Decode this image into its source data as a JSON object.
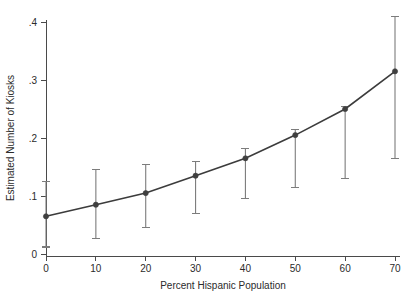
{
  "chart_data": {
    "type": "line",
    "title": "",
    "subtitle": "",
    "xlabel": "Percent Hispanic Population",
    "ylabel": "Estimated Number of Kiosks",
    "x": [
      0,
      10,
      20,
      30,
      40,
      50,
      60,
      70
    ],
    "values": [
      0.065,
      0.085,
      0.105,
      0.135,
      0.165,
      0.205,
      0.25,
      0.315
    ],
    "err_low": [
      0.012,
      0.027,
      0.045,
      0.07,
      0.095,
      0.115,
      0.13,
      0.165
    ],
    "err_high": [
      0.125,
      0.145,
      0.155,
      0.16,
      0.182,
      0.215,
      0.255,
      0.41
    ],
    "xlim": [
      0,
      70
    ],
    "ylim": [
      0,
      0.4
    ],
    "xticks": [
      0,
      10,
      20,
      30,
      40,
      50,
      60,
      70
    ],
    "xtick_labels": [
      "0",
      "10",
      "20",
      "30",
      "40",
      "50",
      "60",
      "70"
    ],
    "yticks": [
      0,
      0.1,
      0.2,
      0.3,
      0.4
    ],
    "ytick_labels": [
      "0",
      ".1",
      ".2",
      ".3",
      ".4"
    ],
    "grid": false,
    "legend": null,
    "series_name": "Estimated Number of Kiosks",
    "marker": "circle",
    "error_bar_style": "capped-vertical",
    "colors": {
      "line": "#3c3c3c",
      "marker": "#3f3f3f",
      "error_bar": "#7c7c7c",
      "axis": "#4a4a4a",
      "text": "#2b2b2b",
      "background": "#ffffff"
    }
  }
}
